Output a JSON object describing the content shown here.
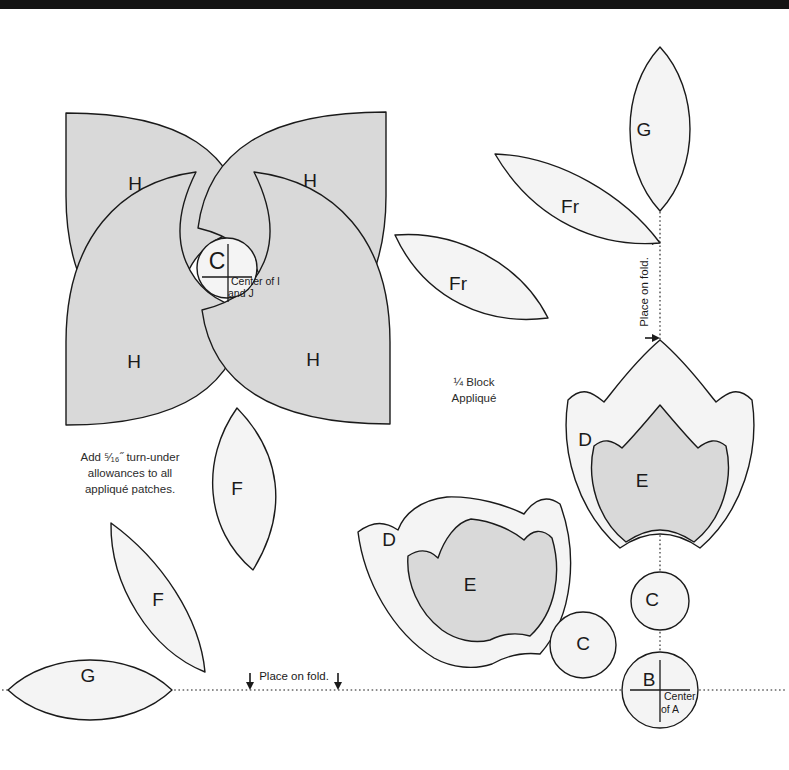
{
  "page": {
    "width": 789,
    "height": 770,
    "background": "#ffffff",
    "topbar_color": "#141414"
  },
  "colors": {
    "shaded_fill": "#d9d9d9",
    "plain_fill": "#f4f4f4",
    "outline": "#1a1a1a",
    "text": "#2b2b2b"
  },
  "notes": {
    "allowance_line1": "Add ⁵⁄₁₆˝ turn-under",
    "allowance_line2": "allowances to all",
    "allowance_line3": "appliqué patches.",
    "block_line1": "¼ Block",
    "block_line2": "Appliqué"
  },
  "fold_lines": {
    "vertical_label": "Place on fold.",
    "horizontal_label": "Place on fold."
  },
  "center_marks": {
    "c_center_line1": "Center of I",
    "c_center_line2": "and J",
    "b_center_line1": "Center",
    "b_center_line2": "of A"
  },
  "patches": [
    {
      "id": "h-top-left",
      "label": "H",
      "shaded": true,
      "lx": 135,
      "ly": 185
    },
    {
      "id": "h-top-right",
      "label": "H",
      "shaded": true,
      "lx": 310,
      "ly": 182
    },
    {
      "id": "h-bottom-left",
      "label": "H",
      "shaded": true,
      "lx": 134,
      "ly": 363
    },
    {
      "id": "h-bottom-right",
      "label": "H",
      "shaded": true,
      "lx": 313,
      "ly": 361
    },
    {
      "id": "c-center",
      "label": "C",
      "shaded": false,
      "lx": 219,
      "ly": 263
    },
    {
      "id": "fr-right",
      "label": "Fr",
      "shaded": false,
      "lx": 570,
      "ly": 208
    },
    {
      "id": "fr-left",
      "label": "Fr",
      "shaded": false,
      "lx": 458,
      "ly": 285
    },
    {
      "id": "g-top",
      "label": "G",
      "shaded": false,
      "lx": 644,
      "ly": 131
    },
    {
      "id": "g-bottom",
      "label": "G",
      "shaded": false,
      "lx": 88,
      "ly": 677
    },
    {
      "id": "f-upper",
      "label": "F",
      "shaded": false,
      "lx": 237,
      "ly": 490
    },
    {
      "id": "f-lower",
      "label": "F",
      "shaded": false,
      "lx": 158,
      "ly": 601
    },
    {
      "id": "d-upper-right",
      "label": "D",
      "shaded": false,
      "lx": 585,
      "ly": 441
    },
    {
      "id": "e-upper-right",
      "label": "E",
      "shaded": true,
      "lx": 642,
      "ly": 482
    },
    {
      "id": "d-lower-left",
      "label": "D",
      "shaded": false,
      "lx": 389,
      "ly": 541
    },
    {
      "id": "e-lower-left",
      "label": "E",
      "shaded": true,
      "lx": 470,
      "ly": 586
    },
    {
      "id": "c-standalone",
      "label": "C",
      "shaded": false,
      "lx": 583,
      "ly": 645
    },
    {
      "id": "c-upper-right",
      "label": "C",
      "shaded": false,
      "lx": 652,
      "ly": 601
    },
    {
      "id": "b-corner",
      "label": "B",
      "shaded": false,
      "lx": 650,
      "ly": 681
    }
  ]
}
